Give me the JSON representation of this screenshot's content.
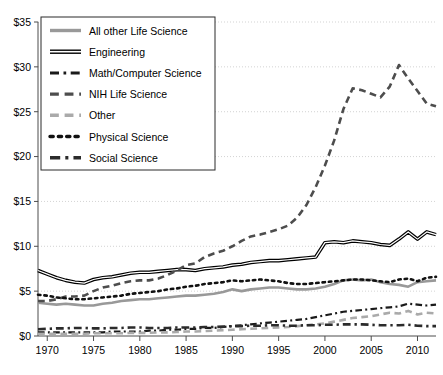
{
  "chart_data": {
    "type": "line",
    "title": "",
    "xlabel": "",
    "ylabel": "",
    "xlim": [
      1969,
      2012
    ],
    "ylim": [
      0,
      35
    ],
    "grid": true,
    "legend_position": "top-left",
    "y_ticks": [
      0,
      5,
      10,
      15,
      20,
      25,
      30,
      35
    ],
    "y_tick_labels": [
      "$0",
      "$5",
      "$10",
      "$15",
      "$20",
      "$25",
      "$30",
      "$35"
    ],
    "x_ticks": [
      1970,
      1975,
      1980,
      1985,
      1990,
      1995,
      2000,
      2005,
      2010
    ],
    "x_tick_labels": [
      "1970",
      "1975",
      "1980",
      "1985",
      "1990",
      "1995",
      "2000",
      "2005",
      "2010"
    ],
    "x": [
      1969,
      1970,
      1971,
      1972,
      1973,
      1974,
      1975,
      1976,
      1977,
      1978,
      1979,
      1980,
      1981,
      1982,
      1983,
      1984,
      1985,
      1986,
      1987,
      1988,
      1989,
      1990,
      1991,
      1992,
      1993,
      1994,
      1995,
      1996,
      1997,
      1998,
      1999,
      2000,
      2001,
      2002,
      2003,
      2004,
      2005,
      2006,
      2007,
      2008,
      2009,
      2010,
      2011,
      2012
    ],
    "series": [
      {
        "name": "All other Life Science",
        "style": "solid",
        "color": "#999999",
        "width": 2.6,
        "values": [
          3.7,
          3.6,
          3.5,
          3.6,
          3.5,
          3.4,
          3.4,
          3.6,
          3.7,
          3.9,
          4.0,
          4.1,
          4.1,
          4.2,
          4.3,
          4.4,
          4.5,
          4.5,
          4.6,
          4.7,
          4.9,
          5.2,
          5.0,
          5.2,
          5.3,
          5.4,
          5.4,
          5.3,
          5.2,
          5.2,
          5.3,
          5.5,
          5.8,
          6.2,
          6.3,
          6.2,
          6.3,
          6.0,
          5.8,
          5.7,
          5.5,
          6.0,
          6.1,
          6.2
        ]
      },
      {
        "name": "Engineering",
        "style": "solid",
        "color": "#1a1a1a",
        "width": 2.2,
        "values": [
          7.3,
          6.9,
          6.5,
          6.2,
          6.0,
          5.9,
          6.3,
          6.5,
          6.6,
          6.8,
          7.0,
          7.1,
          7.1,
          7.2,
          7.3,
          7.4,
          7.4,
          7.3,
          7.5,
          7.6,
          7.7,
          7.9,
          8.0,
          8.2,
          8.3,
          8.4,
          8.4,
          8.5,
          8.6,
          8.7,
          8.8,
          10.4,
          10.5,
          10.4,
          10.6,
          10.5,
          10.4,
          10.2,
          10.1,
          10.8,
          11.6,
          10.8,
          11.6,
          11.3
        ]
      },
      {
        "name": "Math/Computer Science",
        "style": "dashdot",
        "color": "#1a1a1a",
        "width": 2.2,
        "values": [
          0.4,
          0.4,
          0.4,
          0.4,
          0.4,
          0.4,
          0.4,
          0.4,
          0.5,
          0.5,
          0.5,
          0.5,
          0.6,
          0.6,
          0.7,
          0.7,
          0.8,
          0.8,
          0.9,
          0.9,
          1.0,
          1.1,
          1.2,
          1.3,
          1.4,
          1.5,
          1.6,
          1.7,
          1.8,
          1.9,
          2.1,
          2.3,
          2.5,
          2.7,
          2.8,
          2.9,
          3.0,
          3.1,
          3.2,
          3.3,
          3.6,
          3.5,
          3.4,
          3.5
        ]
      },
      {
        "name": "NIH Life Science",
        "style": "dash",
        "color": "#4d4d4d",
        "width": 2.6,
        "values": [
          3.9,
          3.9,
          4.1,
          4.4,
          4.4,
          4.5,
          5.0,
          5.4,
          5.6,
          5.9,
          6.1,
          6.2,
          6.2,
          6.4,
          6.8,
          7.3,
          7.9,
          8.1,
          8.8,
          9.2,
          9.5,
          10.0,
          10.6,
          11.1,
          11.3,
          11.6,
          11.9,
          12.3,
          13.2,
          14.6,
          16.6,
          19.0,
          21.8,
          25.3,
          27.6,
          27.4,
          27.0,
          26.6,
          27.8,
          30.2,
          28.7,
          27.3,
          25.9,
          25.6
        ]
      },
      {
        "name": "Other",
        "style": "dash",
        "color": "#aaaaaa",
        "width": 2.6,
        "values": [
          0.25,
          0.25,
          0.25,
          0.25,
          0.25,
          0.25,
          0.3,
          0.3,
          0.3,
          0.3,
          0.35,
          0.35,
          0.35,
          0.4,
          0.4,
          0.45,
          0.5,
          0.5,
          0.55,
          0.6,
          0.65,
          0.7,
          0.75,
          0.8,
          0.85,
          0.9,
          0.95,
          1.0,
          1.1,
          1.2,
          1.3,
          1.4,
          1.6,
          1.8,
          2.0,
          2.1,
          2.2,
          2.4,
          2.6,
          2.5,
          2.8,
          2.4,
          2.6,
          2.5
        ]
      },
      {
        "name": "Physical Science",
        "style": "dot",
        "color": "#111111",
        "width": 2.6,
        "values": [
          4.6,
          4.5,
          4.3,
          4.2,
          4.1,
          4.1,
          4.2,
          4.3,
          4.4,
          4.5,
          4.7,
          4.8,
          4.9,
          5.0,
          5.2,
          5.3,
          5.5,
          5.6,
          5.8,
          5.9,
          6.0,
          6.2,
          6.1,
          6.2,
          6.3,
          6.2,
          6.1,
          5.9,
          5.8,
          5.8,
          5.9,
          6.0,
          6.1,
          6.2,
          6.3,
          6.3,
          6.2,
          6.1,
          6.0,
          6.3,
          6.4,
          6.1,
          6.5,
          6.6
        ]
      },
      {
        "name": "Social Science",
        "style": "dashdot",
        "color": "#2b2b2b",
        "width": 2.6,
        "values": [
          0.75,
          0.8,
          0.85,
          0.85,
          0.9,
          0.9,
          0.85,
          0.85,
          0.9,
          0.9,
          0.95,
          0.95,
          0.9,
          0.9,
          0.9,
          0.95,
          0.95,
          0.95,
          1.0,
          1.0,
          1.05,
          1.1,
          1.1,
          1.15,
          1.15,
          1.2,
          1.2,
          1.15,
          1.15,
          1.2,
          1.2,
          1.25,
          1.25,
          1.3,
          1.3,
          1.3,
          1.25,
          1.2,
          1.2,
          1.2,
          1.25,
          1.15,
          1.1,
          1.1
        ]
      }
    ]
  },
  "legend": {
    "items": [
      {
        "label": "All other Life Science",
        "swatch": "solid-gray-thick"
      },
      {
        "label": "Engineering",
        "swatch": "solid-black-thick"
      },
      {
        "label": "Math/Computer Science",
        "swatch": "dashdot-black"
      },
      {
        "label": "NIH Life Science",
        "swatch": "solid-dark-gray"
      },
      {
        "label": "Other",
        "swatch": "dash-light-gray"
      },
      {
        "label": "Physical Science",
        "swatch": "dot-black"
      },
      {
        "label": "Social Science",
        "swatch": "dashdot-dark"
      }
    ]
  }
}
